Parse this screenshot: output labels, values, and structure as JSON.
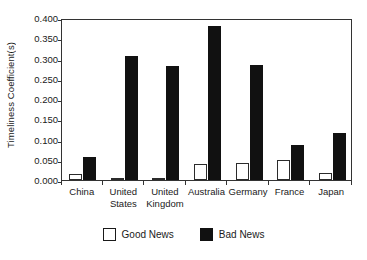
{
  "chart_data": {
    "type": "bar",
    "title": "",
    "xlabel": "",
    "ylabel": "Timeliness Coefficient(s)",
    "categories": [
      "China",
      "United States",
      "United Kingdom",
      "Australia",
      "Germany",
      "France",
      "Japan"
    ],
    "category_lines": [
      [
        "China"
      ],
      [
        "United",
        "States"
      ],
      [
        "United",
        "Kingdom"
      ],
      [
        "Australia"
      ],
      [
        "Germany"
      ],
      [
        "France"
      ],
      [
        "Japan"
      ]
    ],
    "series": [
      {
        "name": "Good News",
        "color": "#ffffff",
        "edge_color": "#2b2b2b",
        "values": [
          0.015,
          0.002,
          0.004,
          0.04,
          0.042,
          0.049,
          0.017
        ]
      },
      {
        "name": "Bad News",
        "color": "#111111",
        "edge_color": "#111111",
        "values": [
          0.057,
          0.306,
          0.281,
          0.38,
          0.284,
          0.086,
          0.117
        ]
      }
    ],
    "ylim": [
      0.0,
      0.4
    ],
    "yticks": [
      0.0,
      0.05,
      0.1,
      0.15,
      0.2,
      0.25,
      0.3,
      0.35,
      0.4
    ],
    "ytick_labels": [
      "0.000",
      "0.050",
      "0.100",
      "0.150",
      "0.200",
      "0.250",
      "0.300",
      "0.350",
      "0.400"
    ],
    "grid": false,
    "legend_position": "bottom"
  },
  "legend": {
    "entries": [
      {
        "label": "Good News",
        "swatch": "good"
      },
      {
        "label": "Bad News",
        "swatch": "bad"
      }
    ]
  }
}
